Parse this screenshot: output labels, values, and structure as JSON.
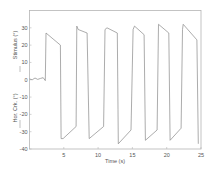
{
  "chart_data": {
    "type": "line",
    "title": "",
    "xlabel": "Time (s)",
    "ylabel_top": "Stimulus (°)",
    "ylabel_bottom": "Hor. Crk. (°)",
    "xlim": [
      0,
      25
    ],
    "ylim": [
      -40,
      40
    ],
    "grid": false,
    "legend": null,
    "x_ticks": [
      5,
      10,
      15,
      20,
      25
    ],
    "y_ticks": [
      30,
      20,
      10,
      0,
      -10,
      -20,
      -30,
      -40
    ],
    "series": [
      {
        "name": "Hor. Crk.",
        "color": "#888888",
        "points": [
          [
            0.0,
            0.5
          ],
          [
            0.4,
            0.0
          ],
          [
            0.8,
            1.0
          ],
          [
            1.2,
            0.2
          ],
          [
            1.6,
            0.8
          ],
          [
            2.0,
            1.2
          ],
          [
            2.3,
            -0.5
          ],
          [
            2.4,
            27
          ],
          [
            4.5,
            20
          ],
          [
            4.6,
            -34
          ],
          [
            4.9,
            -34
          ],
          [
            6.8,
            -27
          ],
          [
            6.9,
            31
          ],
          [
            7.1,
            29
          ],
          [
            8.4,
            27
          ],
          [
            8.7,
            -34
          ],
          [
            10.8,
            -27
          ],
          [
            11.0,
            29
          ],
          [
            11.3,
            30
          ],
          [
            12.8,
            27
          ],
          [
            12.9,
            -17
          ],
          [
            12.95,
            -37
          ],
          [
            14.8,
            -29
          ],
          [
            15.1,
            29
          ],
          [
            15.3,
            31
          ],
          [
            16.7,
            26
          ],
          [
            16.9,
            -35
          ],
          [
            18.6,
            -29
          ],
          [
            18.8,
            32
          ],
          [
            20.3,
            27
          ],
          [
            20.5,
            -35
          ],
          [
            22.1,
            -28
          ],
          [
            22.3,
            29
          ],
          [
            22.4,
            32
          ],
          [
            24.4,
            23
          ],
          [
            24.6,
            -37
          ]
        ]
      }
    ]
  }
}
